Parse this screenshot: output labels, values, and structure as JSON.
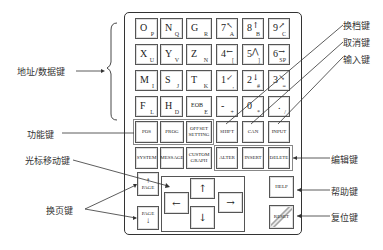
{
  "labels": {
    "address_data_keys": "地址/数据键",
    "function_keys": "功能键",
    "cursor_keys": "光标移动键",
    "page_keys": "换页键",
    "shift_key": "换档键",
    "cancel_key": "取消键",
    "input_key": "输入键",
    "edit_keys": "编辑键",
    "help_key": "帮助键",
    "reset_key": "复位键"
  },
  "address_keys": [
    {
      "main": "O",
      "sub": "P"
    },
    {
      "main": "N",
      "sub": "Q"
    },
    {
      "main": "G",
      "sub": "R"
    },
    {
      "main": "X",
      "sub": "U"
    },
    {
      "main": "Y",
      "sub": "V"
    },
    {
      "main": "Z",
      "sub": "N"
    },
    {
      "main": "M",
      "sub": "I"
    },
    {
      "main": "S",
      "sub": "J"
    },
    {
      "main": "T",
      "sub": "K"
    },
    {
      "main": "F",
      "sub": "L"
    },
    {
      "main": "H",
      "sub": "D"
    },
    {
      "main": "EOB",
      "sub": "E"
    }
  ],
  "numeric_keys": [
    {
      "main": "7",
      "sym": "↖",
      "sub": "A"
    },
    {
      "main": "8",
      "sym": "↑",
      "sub": "B"
    },
    {
      "main": "9",
      "sym": "↗",
      "sub": "C"
    },
    {
      "main": "4",
      "sym": "←",
      "sub": "["
    },
    {
      "main": "5",
      "sym": "⋀",
      "sub": "]"
    },
    {
      "main": "6",
      "sym": "→",
      "sub": "SP"
    },
    {
      "main": "1",
      "sym": "↙",
      "sub": ","
    },
    {
      "main": "2",
      "sym": "↓",
      "sub": "#"
    },
    {
      "main": "3",
      "sym": "↘",
      "sub": "="
    },
    {
      "main": "-",
      "sym": "",
      "sub": "+"
    },
    {
      "main": "0",
      "sym": "",
      "sub": "*"
    },
    {
      "main": ".",
      "sym": "",
      "sub": "/"
    }
  ],
  "function_row1": [
    "POS",
    "PROG",
    "OFFSET SETTING",
    "SHIFT",
    "CAN",
    "INPUT"
  ],
  "function_row2": [
    "SYSTEM",
    "MESSAGE",
    "CUSTOM GRAPH",
    "ALTER",
    "INSERT",
    "DELETE"
  ],
  "page_keys": {
    "up": "PAGE",
    "down": "PAGE",
    "up_arrow": "↑",
    "down_arrow": "↓"
  },
  "cursor_keys": {
    "up": "↑",
    "down": "↓",
    "left": "←",
    "right": "→"
  },
  "help": "HELP",
  "reset": "RESET"
}
